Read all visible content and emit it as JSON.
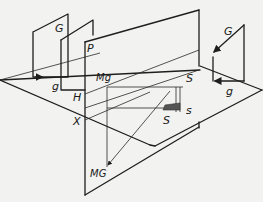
{
  "diagram": {
    "type": "descriptive-geometry projection",
    "labels": {
      "G_left": "G",
      "g_left": "g",
      "P": "P",
      "H": "H",
      "Mg": "Mg",
      "X": "X",
      "MG": "MG",
      "S_upper": "S",
      "S_lower": "S",
      "s": "s",
      "G_right": "G",
      "g_right": "g"
    },
    "elements": [
      "horizontal-plane H",
      "vertical-plane P",
      "frame G/g (left)",
      "frame G/g (right)",
      "point X on axis",
      "point Mg",
      "point MG",
      "point S",
      "point s"
    ]
  }
}
